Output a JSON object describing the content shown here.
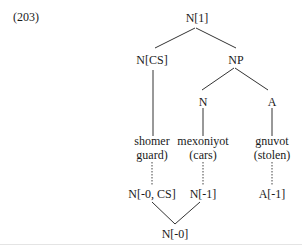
{
  "example_number": "(203)",
  "tree": {
    "root": "N[1]",
    "left_child": "N[CS]",
    "right_child": "NP",
    "np_left": "N",
    "np_right": "A",
    "leaves": [
      {
        "word": "shomer",
        "gloss": "guard)"
      },
      {
        "word": "mexoniyot",
        "gloss": "(cars)"
      },
      {
        "word": "gnuvot",
        "gloss": "(stolen)"
      }
    ],
    "lower": [
      {
        "label": "N[-0, CS]"
      },
      {
        "label": "N[-1]"
      },
      {
        "label": "A[-1]"
      }
    ],
    "lower_root": "N[-0]"
  },
  "colors": {
    "line": "#333333",
    "text": "#1a1a1a",
    "background": "#ffffff"
  }
}
